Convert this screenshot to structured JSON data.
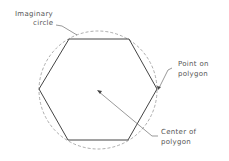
{
  "diagram": {
    "labels": {
      "imaginary_circle_line1": "Imaginary",
      "imaginary_circle_line2": "circle",
      "point_line1": "Point on",
      "point_line2": "polygon",
      "center_line1": "Center of",
      "center_line2": "polygon"
    },
    "shape": {
      "type": "hexagon",
      "sides": 6
    },
    "colors": {
      "stroke": "#444444",
      "circle": "#999999",
      "text": "#555555"
    }
  }
}
